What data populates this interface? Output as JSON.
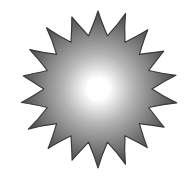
{
  "image": {
    "subject": "sun",
    "width": 191,
    "height": 180,
    "background": "#ffffff"
  },
  "sun": {
    "center": [
      98,
      89
    ],
    "ray_count": 18,
    "outer_radius": 78,
    "inner_radius": 54,
    "rotation_deg": 0,
    "gradient": {
      "center_color": "#ffffff",
      "mid_color": "#b4b4b4",
      "edge_color": "#4a4a4a",
      "outline_color": "#3a3a3a"
    }
  }
}
